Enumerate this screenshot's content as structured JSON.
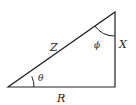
{
  "diagram": {
    "type": "impedance-triangle",
    "labels": {
      "hypotenuse": "Z",
      "vertical": "X",
      "horizontal": "R",
      "angle_bottom": "θ",
      "angle_top": "ϕ"
    },
    "colors": {
      "stroke": "#222222",
      "background": "#ffffff"
    }
  }
}
